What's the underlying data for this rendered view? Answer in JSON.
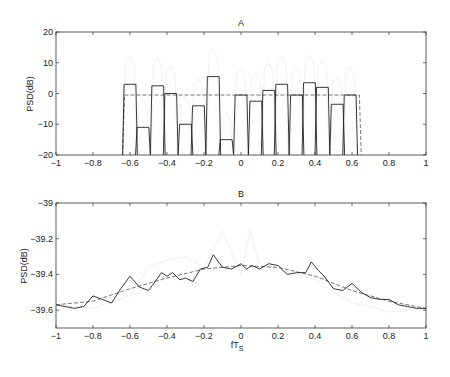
{
  "chart_data": [
    {
      "type": "line",
      "title": "A",
      "xlabel": "",
      "ylabel": "PSD(dB)",
      "xlim": [
        -1,
        1
      ],
      "ylim": [
        -20,
        20
      ],
      "xticks": [
        "-1",
        "-0.8",
        "-0.6",
        "-0.4",
        "-0.2",
        "0",
        "0.2",
        "0.4",
        "0.6",
        "0.8",
        "1"
      ],
      "yticks": [
        "20",
        "10",
        "0",
        "-10",
        "-20"
      ],
      "grid": false,
      "series": [
        {
          "name": "subband PSD (solid)",
          "style": "solid",
          "bands": [
            {
              "center": -0.6,
              "level": 3
            },
            {
              "center": -0.53,
              "level": -11
            },
            {
              "center": -0.45,
              "level": 2.5
            },
            {
              "center": -0.38,
              "level": 0
            },
            {
              "center": -0.3,
              "level": -10
            },
            {
              "center": -0.23,
              "level": -4
            },
            {
              "center": -0.15,
              "level": 5.5
            },
            {
              "center": -0.08,
              "level": -15
            },
            {
              "center": 0.0,
              "level": -0.5
            },
            {
              "center": 0.08,
              "level": -2.5
            },
            {
              "center": 0.15,
              "level": 1
            },
            {
              "center": 0.22,
              "level": 3
            },
            {
              "center": 0.3,
              "level": -0.5
            },
            {
              "center": 0.37,
              "level": 3.5
            },
            {
              "center": 0.44,
              "level": 2
            },
            {
              "center": 0.52,
              "level": -3.5
            },
            {
              "center": 0.59,
              "level": -0.5
            }
          ],
          "band_width": 0.07
        },
        {
          "name": "flat reference (dashed)",
          "style": "dashed",
          "x": [
            -0.64,
            -0.63,
            0.64,
            0.65
          ],
          "values": [
            -20,
            -0.5,
            -0.5,
            -20
          ]
        },
        {
          "name": "alternate PSD (dotted, light)",
          "style": "dotted",
          "note": "light gray dotted peaks reaching ~+8 to +10 dB above bands"
        }
      ]
    },
    {
      "type": "line",
      "title": "B",
      "xlabel": "fT_s",
      "ylabel": "PSD(dB)",
      "xlim": [
        -1,
        1
      ],
      "ylim": [
        -39.7,
        -39
      ],
      "xticks": [
        "-1",
        "-0.8",
        "-0.6",
        "-0.4",
        "-0.2",
        "0",
        "0.2",
        "0.4",
        "0.6",
        "0.8",
        "1"
      ],
      "yticks": [
        "-39",
        "-39.2",
        "-39.4",
        "-39.6"
      ],
      "grid": false,
      "series": [
        {
          "name": "solid",
          "style": "solid",
          "x": [
            -1,
            -0.95,
            -0.9,
            -0.85,
            -0.8,
            -0.75,
            -0.7,
            -0.65,
            -0.6,
            -0.55,
            -0.5,
            -0.45,
            -0.43,
            -0.4,
            -0.37,
            -0.33,
            -0.3,
            -0.26,
            -0.22,
            -0.18,
            -0.15,
            -0.1,
            -0.05,
            0,
            0.03,
            0.06,
            0.1,
            0.15,
            0.2,
            0.25,
            0.3,
            0.35,
            0.38,
            0.42,
            0.45,
            0.5,
            0.55,
            0.6,
            0.65,
            0.7,
            0.75,
            0.8,
            0.85,
            0.9,
            0.95,
            1
          ],
          "values": [
            -39.57,
            -39.58,
            -39.59,
            -39.58,
            -39.52,
            -39.54,
            -39.56,
            -39.48,
            -39.41,
            -39.47,
            -39.49,
            -39.42,
            -39.39,
            -39.41,
            -39.39,
            -39.43,
            -39.42,
            -39.44,
            -39.37,
            -39.36,
            -39.29,
            -39.36,
            -39.37,
            -39.34,
            -39.37,
            -39.35,
            -39.37,
            -39.34,
            -39.35,
            -39.4,
            -39.39,
            -39.39,
            -39.33,
            -39.38,
            -39.41,
            -39.48,
            -39.49,
            -39.45,
            -39.5,
            -39.53,
            -39.54,
            -39.54,
            -39.57,
            -39.58,
            -39.59,
            -39.59
          ]
        },
        {
          "name": "dashed",
          "style": "dashed",
          "x": [
            -1,
            -0.8,
            -0.6,
            -0.4,
            -0.2,
            0,
            0.2,
            0.4,
            0.6,
            0.8,
            1
          ],
          "values": [
            -39.57,
            -39.55,
            -39.48,
            -39.42,
            -39.37,
            -39.35,
            -39.36,
            -39.41,
            -39.49,
            -39.55,
            -39.59
          ]
        },
        {
          "name": "dotted (light)",
          "style": "dotted",
          "x": [
            -1,
            -0.8,
            -0.6,
            -0.5,
            -0.4,
            -0.3,
            -0.2,
            -0.1,
            0,
            0.05,
            0.1,
            0.2,
            0.3,
            0.4,
            0.5,
            0.6,
            0.7,
            0.8,
            0.9,
            1
          ],
          "values": [
            -39.57,
            -39.59,
            -39.52,
            -39.36,
            -39.32,
            -39.3,
            -39.36,
            -39.16,
            -39.4,
            -39.15,
            -39.35,
            -39.37,
            -39.4,
            -39.43,
            -39.5,
            -39.56,
            -39.58,
            -39.61,
            -39.6,
            -39.59
          ]
        }
      ]
    }
  ],
  "labels": {
    "a_title": "A",
    "b_title": "B",
    "ylabel": "PSD(dB)",
    "xlabel_main": "fT",
    "xlabel_sub": "S"
  }
}
